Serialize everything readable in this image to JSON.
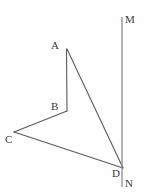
{
  "figure": {
    "type": "geometry-diagram",
    "width": 147,
    "height": 196,
    "background_color": "#fefefe",
    "stroke_color": "#5a5a5a",
    "label_color": "#3a3a3a",
    "stroke_width": 1,
    "labels": {
      "a": "A",
      "b": "B",
      "c": "C",
      "d": "D",
      "m": "M",
      "n": "N"
    },
    "points": {
      "A": {
        "x": 67,
        "y": 49
      },
      "B": {
        "x": 67,
        "y": 111
      },
      "C": {
        "x": 14,
        "y": 132
      },
      "D": {
        "x": 123,
        "y": 168
      },
      "M": {
        "x": 122,
        "y": 17
      },
      "N": {
        "x": 122,
        "y": 187
      }
    },
    "segments": [
      {
        "name": "segment-ab",
        "from": "A",
        "to": "B"
      },
      {
        "name": "segment-bc",
        "from": "B",
        "to": "C"
      },
      {
        "name": "segment-cd",
        "from": "C",
        "to": "D"
      },
      {
        "name": "segment-da",
        "from": "D",
        "to": "A"
      },
      {
        "name": "line-mn",
        "from": "M",
        "to": "N"
      }
    ]
  }
}
